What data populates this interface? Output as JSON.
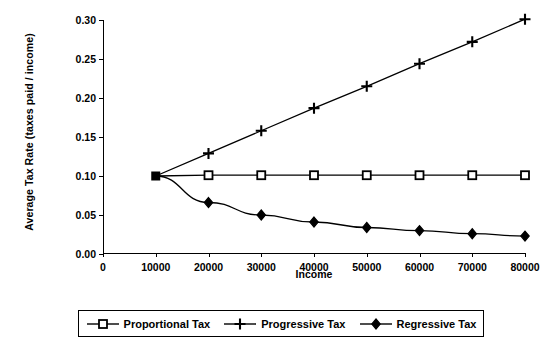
{
  "chart_data": {
    "type": "line",
    "title": "",
    "xlabel": "Income",
    "ylabel": "Average Tax Rate (taxes paid / income)",
    "x": [
      10000,
      20000,
      30000,
      40000,
      50000,
      60000,
      70000,
      80000
    ],
    "xticks": [
      "0",
      "10000",
      "20000",
      "30000",
      "40000",
      "50000",
      "60000",
      "70000",
      "80000"
    ],
    "xtick_values": [
      0,
      10000,
      20000,
      30000,
      40000,
      50000,
      60000,
      70000,
      80000
    ],
    "yticks": [
      "0.00",
      "0.05",
      "0.10",
      "0.15",
      "0.20",
      "0.25",
      "0.30"
    ],
    "ytick_values": [
      0.0,
      0.05,
      0.1,
      0.15,
      0.2,
      0.25,
      0.3
    ],
    "xlim": [
      0,
      80000
    ],
    "ylim": [
      0.0,
      0.3
    ],
    "grid": false,
    "legend_position": "bottom",
    "series": [
      {
        "name": "Proportional Tax",
        "marker": "open-square",
        "color": "#000000",
        "values": [
          0.1,
          0.101,
          0.101,
          0.101,
          0.101,
          0.101,
          0.101,
          0.101
        ]
      },
      {
        "name": "Progressive Tax",
        "marker": "plus",
        "color": "#000000",
        "values": [
          0.1,
          0.129,
          0.158,
          0.187,
          0.215,
          0.244,
          0.272,
          0.301
        ]
      },
      {
        "name": "Regressive Tax",
        "marker": "filled-diamond",
        "color": "#000000",
        "values": [
          0.1,
          0.066,
          0.05,
          0.041,
          0.034,
          0.03,
          0.026,
          0.023
        ]
      }
    ]
  },
  "legend": {
    "items": [
      {
        "label": "Proportional Tax",
        "marker": "open-square"
      },
      {
        "label": "Progressive Tax",
        "marker": "plus"
      },
      {
        "label": "Regressive Tax",
        "marker": "filled-diamond"
      }
    ]
  }
}
